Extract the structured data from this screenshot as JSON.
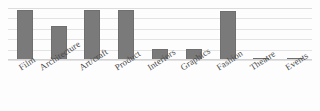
{
  "chart_data": {
    "type": "bar",
    "title": "",
    "subtitle": "",
    "xlabel": "",
    "ylabel": "",
    "ylim": [
      0,
      50
    ],
    "grid": true,
    "gridlines": [
      0,
      10,
      20,
      30,
      40,
      50
    ],
    "legend": "none",
    "orientation": "vertical",
    "bar_color": "#7a7a7a",
    "categories": [
      "Film",
      "Architecture",
      "Art/craft",
      "Product",
      "Interiors",
      "Graphics",
      "Fashion",
      "Theatre",
      "Events"
    ],
    "values": [
      48,
      33,
      48,
      48,
      11,
      11,
      47,
      2,
      2
    ]
  },
  "colors": {
    "bar": "#7a7a7a",
    "bar_border": "#6f6f6f",
    "gridline": "#e3e3e3",
    "baseline": "#d2d2d2",
    "label_text": "#4a4a4a",
    "background": "#fdfdfd"
  }
}
